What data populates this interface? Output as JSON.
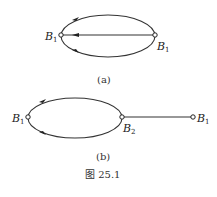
{
  "figure": {
    "caption": "图 25.1",
    "panels": [
      {
        "id": "a",
        "label": "(a)",
        "nodes": [
          {
            "name": "B",
            "sub": "1",
            "x": 61,
            "y": 35
          },
          {
            "name": "B",
            "sub": "1",
            "x": 155,
            "y": 35
          }
        ],
        "edges": [
          "upper-arc B1→B1",
          "straight B1→B1",
          "lower-arc B1→B1"
        ]
      },
      {
        "id": "b",
        "label": "(b)",
        "nodes": [
          {
            "name": "B",
            "sub": "1",
            "x": 28,
            "y": 117
          },
          {
            "name": "B",
            "sub": "2",
            "x": 122,
            "y": 117
          },
          {
            "name": "B",
            "sub": "1",
            "x": 193,
            "y": 117
          }
        ],
        "edges": [
          "upper-arc B1→B2",
          "lower-arc B1→B2",
          "straight B2—B1"
        ]
      }
    ]
  },
  "labels": {
    "a_left": "B",
    "a_left_sub": "1",
    "a_right": "B",
    "a_right_sub": "1",
    "b_left": "B",
    "b_left_sub": "1",
    "b_mid": "B",
    "b_mid_sub": "2",
    "b_right": "B",
    "b_right_sub": "1",
    "panel_a": "(a)",
    "panel_b": "(b)",
    "caption": "图 25.1"
  }
}
